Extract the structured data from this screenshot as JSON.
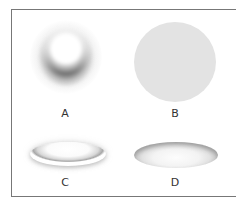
{
  "figure": {
    "panels": [
      {
        "label": "A",
        "shape": "soft sphere with dark lower crescent shadow"
      },
      {
        "label": "B",
        "shape": "flat light gray circle"
      },
      {
        "label": "C",
        "shape": "raised (embossed) flat ellipse"
      },
      {
        "label": "D",
        "shape": "recessed (debossed) flat ellipse"
      }
    ],
    "colors": {
      "background": "#ffffff",
      "frame": "#777777",
      "disc_fill": "#e3e3e3",
      "shadow": "#5a5a5a",
      "label": "#333333"
    }
  }
}
